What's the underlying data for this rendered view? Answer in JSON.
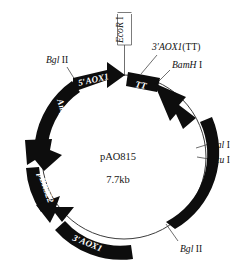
{
  "figure": {
    "kind": "plasmid-map",
    "background_color": "#ffffff",
    "feature_color": "#0d0d0d",
    "backbone_color": "#3c3c3c",
    "label_color": "#111111",
    "feature_text_color": "#ffffff",
    "width": 249,
    "height": 267
  },
  "center": {
    "name": "pAO815",
    "size": "7.7kb"
  },
  "features": [
    {
      "id": "five-aox1",
      "label": "5′AOX1",
      "shape": "arrow",
      "direction": "clockwise"
    },
    {
      "id": "tt",
      "label": "TT",
      "shape": "box",
      "direction": "none"
    },
    {
      "id": "his4",
      "label": "His4",
      "shape": "arc-arrow",
      "direction": "counterclockwise"
    },
    {
      "id": "three-aox1",
      "label": "3′AOX1",
      "shape": "arc-box",
      "direction": "none"
    },
    {
      "id": "pbr322",
      "label": "pBR322",
      "shape": "arc-arrow",
      "direction": "counterclockwise"
    },
    {
      "id": "ampicillin",
      "label": "Ampicillin",
      "shape": "arc-arrow",
      "direction": "counterclockwise"
    }
  ],
  "restriction_sites": [
    {
      "id": "ecor1",
      "enzyme": "EcoR",
      "numeral": "I",
      "position": "top",
      "orientation": "vertical",
      "has_bracket": true
    },
    {
      "id": "bgl2-top",
      "enzyme": "Bgl",
      "numeral": "II",
      "position": "top-left",
      "orientation": "horizontal",
      "has_bracket": false
    },
    {
      "id": "bamh1",
      "enzyme": "BamH",
      "numeral": "I",
      "position": "top-right",
      "orientation": "horizontal",
      "has_bracket": false
    },
    {
      "id": "sal1",
      "enzyme": "Sal",
      "numeral": "I",
      "position": "right-upper",
      "orientation": "horizontal",
      "has_bracket": false
    },
    {
      "id": "stu1",
      "enzyme": "Stu",
      "numeral": "I",
      "position": "right-lower",
      "orientation": "horizontal",
      "has_bracket": false
    },
    {
      "id": "bgl2-bottom",
      "enzyme": "Bgl",
      "numeral": "II",
      "position": "bottom-right",
      "orientation": "horizontal",
      "has_bracket": false
    }
  ],
  "annotations": {
    "three_aox1_tt": "3′AOX1(TT)"
  },
  "labels": {
    "ecor1_italic": "EcoR",
    "ecor1_roman": " I",
    "bgl2_italic": "Bgl",
    "bgl2_roman": " II",
    "bamh1_italic": "BamH",
    "bamh1_roman": " I",
    "sal1_italic": "Sal",
    "sal1_roman": " I",
    "stu1_italic": "Stu",
    "stu1_roman": " I",
    "three_aox1_tt_italic": "3′AOX1",
    "three_aox1_tt_roman": "(TT)",
    "five_aox1": "5′AOX1",
    "three_aox1": "3′AOX1",
    "tt": "TT",
    "his4": "His4",
    "pbr322": "pBR322",
    "ampicillin": "Ampicillin",
    "plasmid_name": "pAO815",
    "plasmid_size": "7.7kb"
  }
}
